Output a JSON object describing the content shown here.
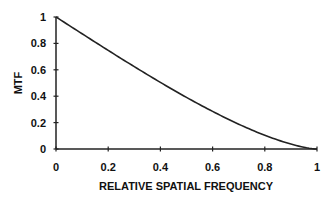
{
  "chart_data": {
    "type": "line",
    "title": "",
    "xlabel": "RELATIVE SPATIAL FREQUENCY",
    "ylabel": "MTF",
    "xlim": [
      0,
      1
    ],
    "ylim": [
      0,
      1
    ],
    "grid": false,
    "legend": null,
    "x_ticks": [
      "0",
      "0.2",
      "0.4",
      "0.6",
      "0.8",
      "1"
    ],
    "y_ticks": [
      "0",
      "0.2",
      "0.4",
      "0.6",
      "0.8",
      "1"
    ],
    "series": [
      {
        "name": "MTF",
        "color": "#222222",
        "x": [
          0,
          0.1,
          0.2,
          0.3,
          0.4,
          0.5,
          0.6,
          0.7,
          0.8,
          0.9,
          1.0
        ],
        "y": [
          1.0,
          0.873,
          0.747,
          0.624,
          0.505,
          0.391,
          0.285,
          0.188,
          0.104,
          0.037,
          0.0
        ]
      }
    ]
  }
}
